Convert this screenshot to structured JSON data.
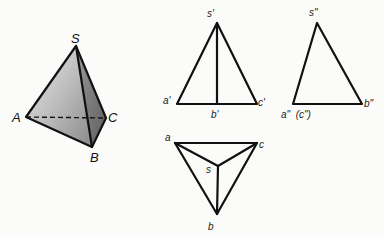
{
  "pyramid_3d": {
    "labels": {
      "apex": "S",
      "a": "A",
      "b": "B",
      "c": "C"
    },
    "colors": {
      "face_light": "#d9d9d9",
      "face_dark": "#6f6f6f",
      "edge": "#111111"
    }
  },
  "front_view": {
    "labels": {
      "apex": "s'",
      "a": "a'",
      "b": "b'",
      "c": "c'"
    }
  },
  "side_view": {
    "labels": {
      "apex": "s\"",
      "a_c": "a\"  (c\")",
      "b": "b\""
    }
  },
  "top_view": {
    "labels": {
      "apex": "s",
      "a": "a",
      "b": "b",
      "c": "c"
    }
  }
}
